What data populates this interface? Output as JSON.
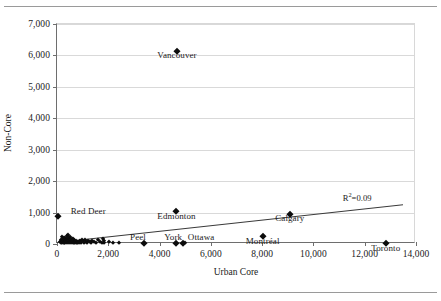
{
  "chart_data": {
    "type": "scatter",
    "title": "",
    "xlabel": "Urban Core",
    "ylabel": "Non-Core",
    "xlim": [
      0,
      14000
    ],
    "ylim": [
      0,
      7000
    ],
    "xticks": [
      0,
      2000,
      4000,
      6000,
      8000,
      10000,
      12000,
      14000
    ],
    "xtick_labels": [
      "0",
      "2,000",
      "4,000",
      "6,000",
      "8,000",
      "10,000",
      "12,000",
      "14,000"
    ],
    "yticks": [
      0,
      1000,
      2000,
      3000,
      4000,
      5000,
      6000,
      7000
    ],
    "ytick_labels": [
      "0",
      "1,000",
      "2,000",
      "3,000",
      "4,000",
      "5,000",
      "6,000",
      "7,000"
    ],
    "grid": "horizontal",
    "legend": "none",
    "annotations": [
      {
        "text": "R²=0.09",
        "x": 12700,
        "y": 1480
      }
    ],
    "trendline": {
      "label": "R²=0.09",
      "r_squared": 0.09,
      "x_start": 0,
      "y_start": 70,
      "x_end": 13500,
      "y_end": 1270
    },
    "labeled_points": [
      {
        "label": "Vancouver",
        "x": 4680,
        "y": 6150,
        "label_dx": 0,
        "label_dy": -170
      },
      {
        "label": "Edmonton",
        "x": 4660,
        "y": 1040,
        "label_dx": 0,
        "label_dy": -170
      },
      {
        "label": "Calgary",
        "x": 9080,
        "y": 950,
        "label_dx": 0,
        "label_dy": -170
      },
      {
        "label": "Montéal-placeholder",
        "x": 0,
        "y": 0,
        "label_dx": 0,
        "label_dy": 0
      },
      {
        "label": "Montréal",
        "x": 8020,
        "y": 250,
        "label_dx": 0,
        "label_dy": -180
      },
      {
        "label": "Toronto",
        "x": 12820,
        "y": 40,
        "label_dx": 0,
        "label_dy": -190
      },
      {
        "label": "Red Deer",
        "x": 40,
        "y": 900,
        "label_dx": 1180,
        "label_dy": 130
      },
      {
        "label": "Peel",
        "x": 3390,
        "y": 30,
        "label_dx": -230,
        "label_dy": 175
      },
      {
        "label": "York",
        "x": 4650,
        "y": 25,
        "label_dx": -120,
        "label_dy": 175
      },
      {
        "label": "Ottawa",
        "x": 4900,
        "y": 30,
        "label_dx": 720,
        "label_dy": 175
      }
    ],
    "points": [
      {
        "x": 40,
        "y": 900
      },
      {
        "x": 120,
        "y": 60
      },
      {
        "x": 150,
        "y": 130
      },
      {
        "x": 170,
        "y": 20
      },
      {
        "x": 180,
        "y": 210
      },
      {
        "x": 200,
        "y": 90
      },
      {
        "x": 205,
        "y": 35
      },
      {
        "x": 220,
        "y": 160
      },
      {
        "x": 235,
        "y": 70
      },
      {
        "x": 245,
        "y": 120
      },
      {
        "x": 255,
        "y": 25
      },
      {
        "x": 265,
        "y": 185
      },
      {
        "x": 275,
        "y": 95
      },
      {
        "x": 285,
        "y": 45
      },
      {
        "x": 295,
        "y": 140
      },
      {
        "x": 305,
        "y": 75
      },
      {
        "x": 315,
        "y": 30
      },
      {
        "x": 325,
        "y": 205
      },
      {
        "x": 335,
        "y": 110
      },
      {
        "x": 345,
        "y": 55
      },
      {
        "x": 355,
        "y": 165
      },
      {
        "x": 365,
        "y": 85
      },
      {
        "x": 375,
        "y": 35
      },
      {
        "x": 385,
        "y": 240
      },
      {
        "x": 395,
        "y": 125
      },
      {
        "x": 405,
        "y": 60
      },
      {
        "x": 420,
        "y": 290
      },
      {
        "x": 430,
        "y": 150
      },
      {
        "x": 445,
        "y": 80
      },
      {
        "x": 455,
        "y": 28
      },
      {
        "x": 470,
        "y": 195
      },
      {
        "x": 485,
        "y": 105
      },
      {
        "x": 500,
        "y": 50
      },
      {
        "x": 515,
        "y": 225
      },
      {
        "x": 530,
        "y": 135
      },
      {
        "x": 545,
        "y": 70
      },
      {
        "x": 560,
        "y": 22
      },
      {
        "x": 575,
        "y": 175
      },
      {
        "x": 590,
        "y": 95
      },
      {
        "x": 610,
        "y": 40
      },
      {
        "x": 625,
        "y": 145
      },
      {
        "x": 640,
        "y": 65
      },
      {
        "x": 660,
        "y": 18
      },
      {
        "x": 680,
        "y": 115
      },
      {
        "x": 700,
        "y": 55
      },
      {
        "x": 720,
        "y": 32
      },
      {
        "x": 745,
        "y": 90
      },
      {
        "x": 770,
        "y": 45
      },
      {
        "x": 795,
        "y": 20
      },
      {
        "x": 820,
        "y": 75
      },
      {
        "x": 850,
        "y": 38
      },
      {
        "x": 880,
        "y": 105
      },
      {
        "x": 910,
        "y": 60
      },
      {
        "x": 945,
        "y": 25
      },
      {
        "x": 980,
        "y": 140
      },
      {
        "x": 1010,
        "y": 85
      },
      {
        "x": 1050,
        "y": 42
      },
      {
        "x": 1090,
        "y": 120
      },
      {
        "x": 1130,
        "y": 70
      },
      {
        "x": 1175,
        "y": 30
      },
      {
        "x": 1220,
        "y": 95
      },
      {
        "x": 1270,
        "y": 52
      },
      {
        "x": 1320,
        "y": 22
      },
      {
        "x": 1380,
        "y": 110
      },
      {
        "x": 1440,
        "y": 65
      },
      {
        "x": 1510,
        "y": 35
      },
      {
        "x": 1590,
        "y": 130
      },
      {
        "x": 1660,
        "y": 48
      },
      {
        "x": 1740,
        "y": 25
      },
      {
        "x": 1790,
        "y": 175
      },
      {
        "x": 1820,
        "y": 90
      },
      {
        "x": 1850,
        "y": 38
      },
      {
        "x": 2010,
        "y": 60
      },
      {
        "x": 2180,
        "y": 28
      },
      {
        "x": 2400,
        "y": 45
      },
      {
        "x": 3390,
        "y": 30
      },
      {
        "x": 4650,
        "y": 25
      },
      {
        "x": 4900,
        "y": 30
      },
      {
        "x": 5000,
        "y": 22
      },
      {
        "x": 4660,
        "y": 1040
      },
      {
        "x": 4680,
        "y": 6150
      },
      {
        "x": 8020,
        "y": 250
      },
      {
        "x": 9080,
        "y": 950
      },
      {
        "x": 12820,
        "y": 40
      }
    ]
  }
}
